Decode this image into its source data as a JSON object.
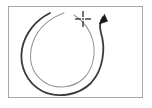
{
  "figure": {
    "title": "Counter-clockwise circular mouse gesture",
    "description": "A nearly closed circular stroke pair drawn counter-clockwise inside a thin rectangular frame, with an arrowhead at the upper right and a crosshair start marker near the top center.",
    "background_color": "#ffffff",
    "frame": {
      "name": "gesture-frame",
      "stroke_color": "#a8a8a8",
      "fill_color": "#ffffff",
      "stroke_width": 1,
      "x": 8,
      "y": 6,
      "width": 135,
      "height": 92
    },
    "strokes": [
      {
        "name": "outer-gesture-stroke",
        "role": "primary gesture path",
        "color": "#3b3b3b",
        "width": 1.8,
        "direction": "counter-clockwise",
        "open_gap": "top",
        "start_point": {
          "x": 50,
          "y": 13
        },
        "end_point": {
          "x": 104,
          "y": 17
        }
      },
      {
        "name": "inner-gesture-stroke",
        "role": "secondary / trailing gesture path",
        "color": "#9a9a9a",
        "width": 1.1,
        "direction": "counter-clockwise",
        "open_gap": "top",
        "start_point": {
          "x": 64,
          "y": 13
        },
        "end_point": {
          "x": 92,
          "y": 78
        }
      }
    ],
    "arrowhead": {
      "name": "gesture-arrowhead",
      "color": "#1a1a1a",
      "tip": {
        "x": 104,
        "y": 15
      },
      "points_toward": "up-right"
    },
    "crosshair": {
      "name": "crosshair-marker",
      "label": "start point",
      "color": "#2a2a2a",
      "center": {
        "x": 83,
        "y": 19
      },
      "arm_length": 6,
      "gap": 2
    }
  }
}
